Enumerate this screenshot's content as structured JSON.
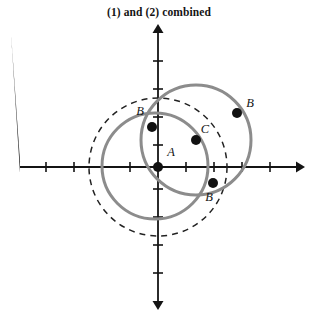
{
  "title": "(1) and (2) combined",
  "figure": {
    "name": "coordinate-plane-with-circles",
    "background_color": "#ffffff",
    "axis_color": "#141414",
    "circle_color": "#8c8c8c",
    "dashed_circle_color": "#222222",
    "point_color": "#111111"
  },
  "axes": {
    "origin": {
      "x": 158,
      "y": 167
    },
    "tick_spacing": 28,
    "x_axis": {
      "x1": 20,
      "y1": 167,
      "x2": 296,
      "y2": 167,
      "arrow_both_ends": true
    },
    "y_axis": {
      "x1": 158,
      "y1": 33,
      "x2": 158,
      "y2": 301,
      "arrow_both_ends": true
    },
    "x_ticks": [
      46,
      74,
      102,
      130,
      186,
      214,
      242,
      270
    ],
    "y_ticks": [
      61,
      89,
      117,
      145,
      189,
      217,
      245,
      273
    ],
    "tick_half_length": 5
  },
  "circles": [
    {
      "name": "dashed-circle-centered-at-A",
      "cx": 158,
      "cy": 167,
      "r": 69,
      "stroke": "#222222",
      "stroke_width": 1.5,
      "dashed": true,
      "dash_pattern": "6 5"
    },
    {
      "name": "gray-circle-lower-left",
      "cx": 155,
      "cy": 166,
      "r": 53,
      "stroke": "#8c8c8c",
      "stroke_width": 3,
      "dashed": false
    },
    {
      "name": "gray-circle-upper-right-centered-at-C",
      "cx": 196,
      "cy": 140,
      "r": 55,
      "stroke": "#8c8c8c",
      "stroke_width": 3,
      "dashed": false
    }
  ],
  "points": [
    {
      "id": "A",
      "label": "A",
      "x": 158,
      "y": 167,
      "r": 5.0,
      "label_x": 171,
      "label_y": 156
    },
    {
      "id": "B1",
      "label": "B",
      "x": 152,
      "y": 127,
      "r": 5.0,
      "label_x": 140,
      "label_y": 115
    },
    {
      "id": "B2",
      "label": "B",
      "x": 237,
      "y": 113,
      "r": 5.0,
      "label_x": 250,
      "label_y": 107
    },
    {
      "id": "B3",
      "label": "B",
      "x": 213,
      "y": 183,
      "r": 5.0,
      "label_x": 209,
      "label_y": 201
    },
    {
      "id": "C",
      "label": "C",
      "x": 196,
      "y": 140,
      "r": 5.0,
      "label_x": 205,
      "label_y": 133
    }
  ],
  "chart_data": {
    "type": "scatter",
    "title": "(1) and (2) combined",
    "xlabel": "",
    "ylabel": "",
    "grid": false,
    "legend": null,
    "points": [
      {
        "label": "A",
        "x": 0,
        "y": 0
      },
      {
        "label": "B",
        "x": -0.2,
        "y": 1.4
      },
      {
        "label": "B",
        "x": 2.8,
        "y": 1.9
      },
      {
        "label": "B",
        "x": 2.0,
        "y": -0.6
      },
      {
        "label": "C",
        "x": 1.4,
        "y": 1.0
      }
    ],
    "shapes": [
      {
        "kind": "circle",
        "style": "dashed",
        "center": [
          0,
          0
        ],
        "radius": 2.45
      },
      {
        "kind": "circle",
        "style": "solid",
        "center": [
          -0.1,
          0.05
        ],
        "radius": 1.9
      },
      {
        "kind": "circle",
        "style": "solid",
        "center": [
          1.4,
          1.0
        ],
        "radius": 1.95
      }
    ],
    "xlim": [
      -5,
      5
    ],
    "ylim": [
      -5,
      5
    ]
  }
}
